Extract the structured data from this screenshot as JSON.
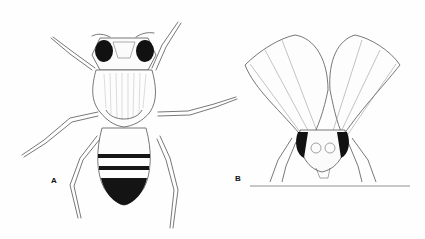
{
  "figure": {
    "type": "scientific-illustration",
    "panels": [
      {
        "label": "A",
        "view": "dorsal view, wings removed"
      },
      {
        "label": "B",
        "view": "frontal view, wings raised"
      }
    ],
    "colors": {
      "background": "#fefefe",
      "ink": "#1a1a1a",
      "stroke": "#555555"
    }
  }
}
